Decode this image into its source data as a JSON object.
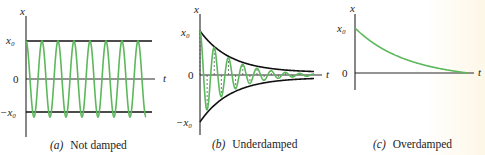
{
  "figure": {
    "colors": {
      "curve": "#5cb85c",
      "axis": "#111111",
      "envelope": "#111111",
      "text": "#222222"
    },
    "panels": [
      {
        "id": "a",
        "caption_letter": "(a)",
        "caption_text": "Not damped",
        "y_axis_label": "x",
        "x_axis_label": "t",
        "tick_labels": [
          "x₀",
          "0",
          "−x₀"
        ]
      },
      {
        "id": "b",
        "caption_letter": "(b)",
        "caption_text": "Underdamped",
        "y_axis_label": "x",
        "x_axis_label": "t",
        "tick_labels": [
          "x₀",
          "0",
          "−x₀"
        ]
      },
      {
        "id": "c",
        "caption_letter": "(c)",
        "caption_text": "Overdamped",
        "y_axis_label": "x",
        "x_axis_label": "t",
        "tick_labels": [
          "x₀",
          "0"
        ]
      }
    ]
  },
  "chart_data": [
    {
      "type": "line",
      "title": "(a) Not damped",
      "xlabel": "t",
      "ylabel": "x",
      "yticks": [
        "x0",
        "0",
        "-x0"
      ],
      "series": [
        {
          "name": "x(t) = x0 cos(ωt)",
          "description": "constant-amplitude oscillation, ~7.5 cycles",
          "amplitude": 1,
          "cycles": 7.5
        }
      ],
      "envelope": {
        "upper": 1,
        "lower": -1
      }
    },
    {
      "type": "line",
      "title": "(b) Underdamped",
      "xlabel": "t",
      "ylabel": "x",
      "yticks": [
        "x0",
        "0",
        "-x0"
      ],
      "series": [
        {
          "name": "x(t) = x0 e^(-γt) cos(ωt)",
          "description": "oscillation decaying within exponential envelope",
          "cycles": 8
        }
      ],
      "envelope": {
        "upper": "x0 e^(-γt)",
        "lower": "-x0 e^(-γt)"
      }
    },
    {
      "type": "line",
      "title": "(c) Overdamped",
      "xlabel": "t",
      "ylabel": "x",
      "yticks": [
        "x0",
        "0"
      ],
      "series": [
        {
          "name": "x(t)",
          "description": "monotonic decay from x0 toward 0 without oscillation"
        }
      ]
    }
  ]
}
